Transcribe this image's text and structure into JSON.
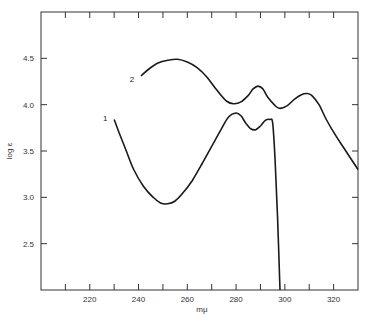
{
  "chart_data": {
    "type": "line",
    "title": "",
    "xlabel": "mμ",
    "ylabel": "log ε",
    "xlim": [
      200,
      330
    ],
    "ylim": [
      2.0,
      5.0
    ],
    "grid": false,
    "legend": "inline curve labels",
    "x_ticks": [
      210,
      220,
      230,
      240,
      250,
      260,
      270,
      280,
      290,
      300,
      310,
      320
    ],
    "x_tick_labels": [
      "220",
      "240",
      "260",
      "280",
      "300",
      "320"
    ],
    "x_tick_label_values": [
      220,
      240,
      260,
      280,
      300,
      320
    ],
    "y_ticks": [
      2.5,
      3.0,
      3.5,
      4.0,
      4.5
    ],
    "y_tick_labels": [
      "2.5",
      "3.0",
      "3.5",
      "4.0",
      "4.5"
    ],
    "series": [
      {
        "name": "1",
        "points": [
          [
            230,
            3.84
          ],
          [
            232,
            3.7
          ],
          [
            235,
            3.5
          ],
          [
            238,
            3.3
          ],
          [
            242,
            3.12
          ],
          [
            246,
            3.0
          ],
          [
            249,
            2.94
          ],
          [
            252,
            2.93
          ],
          [
            255,
            2.96
          ],
          [
            258,
            3.04
          ],
          [
            262,
            3.18
          ],
          [
            266,
            3.36
          ],
          [
            270,
            3.55
          ],
          [
            274,
            3.74
          ],
          [
            277,
            3.87
          ],
          [
            280,
            3.91
          ],
          [
            282,
            3.88
          ],
          [
            284,
            3.8
          ],
          [
            286,
            3.74
          ],
          [
            288,
            3.73
          ],
          [
            290,
            3.77
          ],
          [
            292,
            3.83
          ],
          [
            294,
            3.84
          ],
          [
            295,
            3.8
          ],
          [
            296,
            3.4
          ],
          [
            297,
            2.8
          ],
          [
            298,
            2.0
          ]
        ]
      },
      {
        "name": "2",
        "points": [
          [
            241,
            4.31
          ],
          [
            244,
            4.38
          ],
          [
            248,
            4.45
          ],
          [
            252,
            4.48
          ],
          [
            256,
            4.49
          ],
          [
            260,
            4.46
          ],
          [
            264,
            4.4
          ],
          [
            268,
            4.3
          ],
          [
            272,
            4.16
          ],
          [
            276,
            4.04
          ],
          [
            279,
            4.01
          ],
          [
            282,
            4.03
          ],
          [
            285,
            4.1
          ],
          [
            287,
            4.17
          ],
          [
            289,
            4.2
          ],
          [
            291,
            4.17
          ],
          [
            293,
            4.08
          ],
          [
            296,
            3.99
          ],
          [
            298,
            3.96
          ],
          [
            301,
            3.99
          ],
          [
            304,
            4.06
          ],
          [
            307,
            4.11
          ],
          [
            309,
            4.12
          ],
          [
            311,
            4.1
          ],
          [
            314,
            4.0
          ],
          [
            317,
            3.84
          ],
          [
            321,
            3.66
          ],
          [
            325,
            3.5
          ],
          [
            330,
            3.3
          ]
        ]
      }
    ],
    "curve_labels": [
      {
        "text": "1",
        "x": 228,
        "y": 3.86
      },
      {
        "text": "2",
        "x": 239,
        "y": 4.28
      }
    ]
  }
}
